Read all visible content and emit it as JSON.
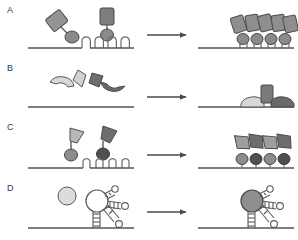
{
  "figure": {
    "width": 298,
    "height": 240,
    "background": "#ffffff"
  },
  "palette": {
    "line": "#4a4a4a",
    "stroke": "#4a4a4a",
    "light_fill": "#d6d6d6",
    "mid_fill": "#9a9a9a",
    "dark_fill": "#5f5f5f",
    "white_fill": "#ffffff",
    "label_color": "#3a3a3a",
    "arrow_color": "#4a4a4a"
  },
  "panels": [
    {
      "id": "A",
      "label": "A",
      "label_x": 7,
      "label_y": 5,
      "baseline_y": 48,
      "left": {
        "description": "Free antibody-like probes: tilted rectangle-plus-ellipse conjugate and an upright rectangle-plus-ellipse conjugate, above a DNA strand bearing four hairpin loops",
        "free_probes": 2,
        "hairpin_loops": 4,
        "hairpin_xs": [
          84,
          97,
          110,
          123
        ],
        "shapes": [
          {
            "name": "tilted-rectangle-probe",
            "fill": "#9a9a9a",
            "rotation": -35,
            "x": 55,
            "y": 18
          },
          {
            "name": "probe-ellipse-light",
            "fill": "#9a9a9a",
            "x": 70,
            "y": 33
          },
          {
            "name": "upright-rectangle-probe",
            "fill": "#7d7d7d",
            "rotation": 0,
            "x": 106,
            "y": 10
          },
          {
            "name": "probe-ellipse-dark",
            "fill": "#8b8b8b",
            "x": 106,
            "y": 30
          }
        ]
      },
      "arrow": {
        "x1": 146,
        "x2": 190,
        "y": 35
      },
      "right": {
        "description": "Probes bound onto the hairpin loops: a row of five tilted rectangles above four stem-bound ellipses",
        "bound_rectangles": 5,
        "bound_ellipses": 4,
        "ellipse_xs": [
          243,
          257,
          271,
          285
        ],
        "rectangle_xs": [
          239,
          252,
          265,
          278,
          289
        ]
      }
    },
    {
      "id": "B",
      "label": "B",
      "label_x": 7,
      "label_y": 63,
      "baseline_y": 107,
      "left": {
        "description": "Free split-protein fragments: a light crescent with a light wedge, and a dark wedge with a dark crescent, above a bare DNA strand",
        "free_fragments": 4,
        "shapes": [
          {
            "name": "crescent-light",
            "fill": "#d6d6d6",
            "x": 58,
            "y": 84
          },
          {
            "name": "wedge-light",
            "fill": "#d6d6d6",
            "x": 78,
            "y": 74
          },
          {
            "name": "wedge-dark",
            "fill": "#6f6f6f",
            "x": 92,
            "y": 76
          },
          {
            "name": "crescent-dark",
            "fill": "#6f6f6f",
            "x": 106,
            "y": 82
          }
        ]
      },
      "arrow": {
        "x1": 146,
        "x2": 190,
        "y": 97
      },
      "right": {
        "description": "Assembled complex on the strand: upright rectangle flanked by a light crescent on the left and a dark crescent on the right",
        "bound_rectangles": 1,
        "bound_crescents": 2,
        "shapes": [
          {
            "name": "crescent-light-bound",
            "fill": "#d6d6d6",
            "x": 252,
            "y": 100
          },
          {
            "name": "rectangle-bound",
            "fill": "#7d7d7d",
            "x": 266,
            "y": 86
          },
          {
            "name": "crescent-dark-bound",
            "fill": "#6f6f6f",
            "x": 280,
            "y": 100
          }
        ]
      }
    },
    {
      "id": "C",
      "label": "C",
      "label_x": 7,
      "label_y": 122,
      "baseline_y": 168,
      "left": {
        "description": "Two free flag-shaped probes on short stems with ellipse bases — one light, one dark — above a DNA strand bearing four small hairpin loops",
        "free_probes": 2,
        "hairpin_loops": 4,
        "hairpin_xs": [
          84,
          97,
          110,
          123
        ],
        "shapes": [
          {
            "name": "flag-probe-light",
            "fill": "#b4b4b4",
            "x": 72,
            "y": 130
          },
          {
            "name": "probe-ellipse-light",
            "fill": "#8b8b8b",
            "x": 72,
            "y": 150
          },
          {
            "name": "flag-probe-dark",
            "fill": "#6f6f6f",
            "x": 105,
            "y": 128
          },
          {
            "name": "probe-ellipse-dark",
            "fill": "#4f4f4f",
            "x": 103,
            "y": 149
          }
        ]
      },
      "arrow": {
        "x1": 146,
        "x2": 190,
        "y": 155
      },
      "right": {
        "description": "Two bound probe pairs, each a light and a dark flag-plus-ellipse conjugate sitting on the strand",
        "bound_pairs": 2,
        "bound_ellipses": 4,
        "ellipse_xs": [
          245,
          258,
          272,
          285
        ],
        "flag_xs": [
          245,
          258,
          272,
          285
        ]
      }
    },
    {
      "id": "D",
      "label": "D",
      "label_x": 7,
      "label_y": 183,
      "baseline_y": 228,
      "left": {
        "description": "A free light circular ligand beside an unbound aptamer: a large open loop on a short double-stranded stem with two branching arms ending in small loops",
        "free_ligands": 1,
        "aptamers": 1,
        "shapes": [
          {
            "name": "ligand-circle-free",
            "fill": "#dcdcdc",
            "x": 67,
            "y": 195,
            "r": 9
          },
          {
            "name": "aptamer-loop-open",
            "fill": "#ffffff",
            "x": 97,
            "y": 200,
            "r": 11
          },
          {
            "name": "aptamer-stem",
            "x": 97,
            "y": 212
          },
          {
            "name": "aptamer-arm-upper",
            "x": 108,
            "y": 195
          },
          {
            "name": "aptamer-arm-lower",
            "x": 108,
            "y": 210
          }
        ]
      },
      "arrow": {
        "x1": 146,
        "x2": 190,
        "y": 212
      },
      "right": {
        "description": "Ligand-bound aptamer: the central loop is now filled dark, stem and branching arms unchanged",
        "bound_ligands": 1,
        "shapes": [
          {
            "name": "aptamer-loop-filled",
            "fill": "#8f8f8f",
            "x": 258,
            "y": 200,
            "r": 11
          },
          {
            "name": "aptamer-stem",
            "x": 258,
            "y": 212
          },
          {
            "name": "aptamer-arm-upper",
            "x": 269,
            "y": 195
          },
          {
            "name": "aptamer-arm-lower",
            "x": 269,
            "y": 210
          }
        ]
      }
    }
  ]
}
